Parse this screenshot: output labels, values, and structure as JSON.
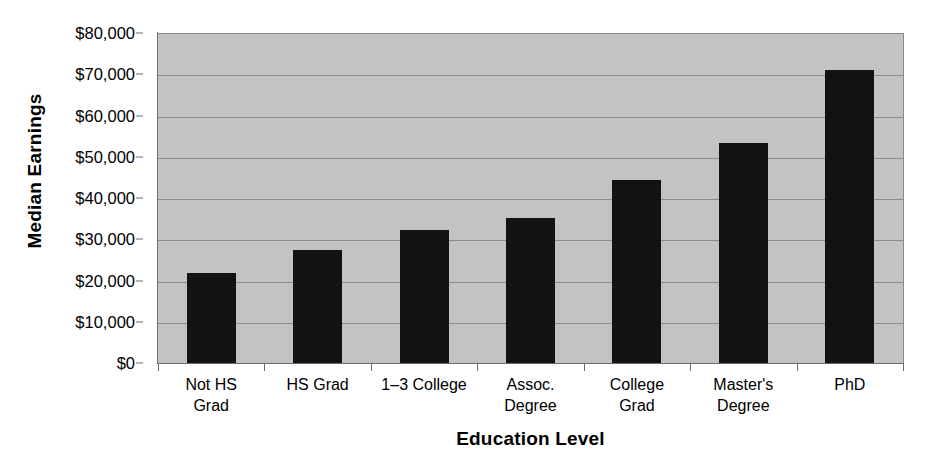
{
  "chart_data": {
    "type": "bar",
    "title": "",
    "xlabel": "Education Level",
    "ylabel": "Median Earnings",
    "categories": [
      "Not HS\nGrad",
      "HS Grad",
      "1–3 College",
      "Assoc.\nDegree",
      "College\nGrad",
      "Master's\nDegree",
      "PhD"
    ],
    "values": [
      21800,
      27400,
      32200,
      35200,
      44400,
      53300,
      71000
    ],
    "ylim": [
      0,
      80000
    ],
    "ytick_values": [
      80000,
      70000,
      60000,
      50000,
      40000,
      30000,
      20000,
      10000,
      0
    ],
    "ytick_labels": [
      "$80,000",
      "$70,000",
      "$60,000",
      "$50,000",
      "$40,000",
      "$30,000",
      "$20,000",
      "$10,000",
      "$0"
    ],
    "grid": true,
    "grid_axis": "y",
    "legend": false,
    "legend_position": "none",
    "bar_color": "#121212",
    "plot_background_color": "#c3c3c3",
    "gridline_color": "#8c8c8c",
    "axis_color": "#6b6b6b",
    "figure_background_color": "#ffffff"
  }
}
